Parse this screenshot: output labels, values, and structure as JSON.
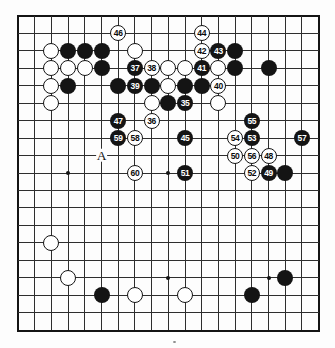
{
  "board": {
    "grid_size": 19,
    "colors": {
      "background": "#fdfdfd",
      "line": "#2e2e2e",
      "frame": "#141414",
      "black_stone": "#141414",
      "white_stone": "#ffffff"
    },
    "star_points": [
      [
        4,
        4
      ],
      [
        10,
        4
      ],
      [
        16,
        4
      ],
      [
        4,
        10
      ],
      [
        10,
        10
      ],
      [
        16,
        10
      ],
      [
        4,
        16
      ],
      [
        10,
        16
      ],
      [
        16,
        16
      ]
    ]
  },
  "moves": [
    {
      "num": "35",
      "color": "black",
      "col": 11,
      "row": 6
    },
    {
      "num": "36",
      "color": "white",
      "col": 9,
      "row": 7
    },
    {
      "num": "37",
      "color": "black",
      "col": 8,
      "row": 4
    },
    {
      "num": "38",
      "color": "white",
      "col": 9,
      "row": 4
    },
    {
      "num": "39",
      "color": "black",
      "col": 8,
      "row": 5
    },
    {
      "num": "40",
      "color": "white",
      "col": 13,
      "row": 5
    },
    {
      "num": "41",
      "color": "black",
      "col": 12,
      "row": 4
    },
    {
      "num": "42",
      "color": "white",
      "col": 12,
      "row": 3
    },
    {
      "num": "43",
      "color": "black",
      "col": 13,
      "row": 3
    },
    {
      "num": "44",
      "color": "white",
      "col": 12,
      "row": 2
    },
    {
      "num": "45",
      "color": "black",
      "col": 11,
      "row": 8
    },
    {
      "num": "46",
      "color": "white",
      "col": 7,
      "row": 2
    },
    {
      "num": "47",
      "color": "black",
      "col": 7,
      "row": 7
    },
    {
      "num": "48",
      "color": "white",
      "col": 16,
      "row": 9
    },
    {
      "num": "49",
      "color": "black",
      "col": 16,
      "row": 10
    },
    {
      "num": "50",
      "color": "white",
      "col": 14,
      "row": 9
    },
    {
      "num": "51",
      "color": "black",
      "col": 11,
      "row": 10
    },
    {
      "num": "52",
      "color": "white",
      "col": 15,
      "row": 10
    },
    {
      "num": "53",
      "color": "black",
      "col": 15,
      "row": 8
    },
    {
      "num": "54",
      "color": "white",
      "col": 14,
      "row": 8
    },
    {
      "num": "55",
      "color": "black",
      "col": 15,
      "row": 7
    },
    {
      "num": "56",
      "color": "white",
      "col": 15,
      "row": 9
    },
    {
      "num": "57",
      "color": "black",
      "col": 18,
      "row": 8
    },
    {
      "num": "58",
      "color": "white",
      "col": 8,
      "row": 8
    },
    {
      "num": "59",
      "color": "black",
      "col": 7,
      "row": 8
    },
    {
      "num": "60",
      "color": "white",
      "col": 8,
      "row": 10
    }
  ],
  "plain_stones": {
    "black": [
      [
        4,
        3
      ],
      [
        5,
        3
      ],
      [
        6,
        3
      ],
      [
        14,
        3
      ],
      [
        6,
        4
      ],
      [
        14,
        4
      ],
      [
        16,
        4
      ],
      [
        4,
        5
      ],
      [
        7,
        5
      ],
      [
        9,
        5
      ],
      [
        11,
        5
      ],
      [
        12,
        5
      ],
      [
        10,
        6
      ],
      [
        17,
        10
      ],
      [
        17,
        16
      ],
      [
        6,
        17
      ],
      [
        15,
        17
      ]
    ],
    "white": [
      [
        3,
        3
      ],
      [
        8,
        3
      ],
      [
        3,
        4
      ],
      [
        4,
        4
      ],
      [
        5,
        4
      ],
      [
        10,
        4
      ],
      [
        11,
        4
      ],
      [
        13,
        4
      ],
      [
        3,
        5
      ],
      [
        10,
        5
      ],
      [
        3,
        6
      ],
      [
        9,
        6
      ],
      [
        13,
        6
      ],
      [
        3,
        14
      ],
      [
        4,
        16
      ],
      [
        8,
        17
      ],
      [
        11,
        17
      ]
    ]
  },
  "labels": [
    {
      "text": "A",
      "col": 6,
      "row": 9
    }
  ]
}
